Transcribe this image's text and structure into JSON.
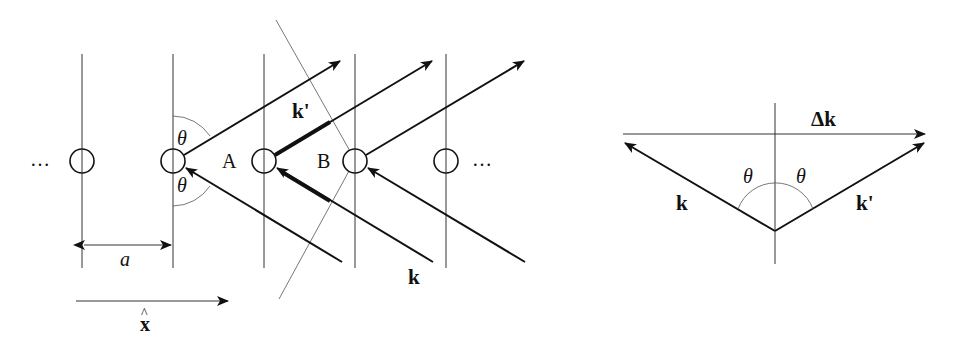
{
  "figure": {
    "left_panel": {
      "ellipsis_left": "…",
      "ellipsis_right": "…",
      "theta_upper": "θ",
      "theta_lower": "θ",
      "point_a": "A",
      "point_b": "B",
      "k_prime_label": "k'",
      "k_label": "k",
      "spacing_label": "a",
      "axis_label": "x",
      "axis_hat": "^",
      "atom_count": 5,
      "lattice_lines": 5
    },
    "right_panel": {
      "delta_k_label": "Δk",
      "k_label": "k",
      "k_prime_label": "k'",
      "theta_left": "θ",
      "theta_right": "θ"
    },
    "colors": {
      "ink": "#111111",
      "background": "#ffffff"
    }
  }
}
